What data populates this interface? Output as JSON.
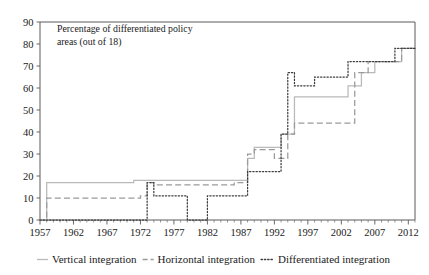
{
  "chart_data": {
    "type": "line",
    "title": "Percentage of differentiated policy areas (out of 18)",
    "title_line1": "Percentage of differentiated policy",
    "title_line2": "areas (out of 18)",
    "xlabel": "",
    "ylabel": "",
    "xlim": [
      1957,
      2013
    ],
    "ylim": [
      0,
      90
    ],
    "ytick_step": 10,
    "xtick_step": 5,
    "grid": false,
    "minor_ticks": "yearly",
    "legend_position": "bottom",
    "yticks": [
      0,
      10,
      20,
      30,
      40,
      50,
      60,
      70,
      80,
      90
    ],
    "xticks": [
      1957,
      1962,
      1967,
      1972,
      1977,
      1982,
      1987,
      1992,
      1997,
      2002,
      2007,
      2012
    ],
    "series": [
      {
        "name": "Vertical integration",
        "style": "solid",
        "color": "#b9b9b9",
        "x": [
          1957,
          1958,
          1959,
          1967,
          1968,
          1970,
          1971,
          1972,
          1973,
          1980,
          1981,
          1986,
          1987,
          1988,
          1989,
          1990,
          1991,
          1992,
          1993,
          1994,
          1995,
          1996,
          1997,
          1998,
          1999,
          2000,
          2001,
          2002,
          2003,
          2004,
          2005,
          2006,
          2007,
          2008,
          2009,
          2010,
          2011,
          2012,
          2013
        ],
        "values": [
          0,
          17,
          17,
          17,
          17,
          17,
          18,
          18,
          18,
          18,
          18,
          18,
          18,
          28,
          33,
          33,
          33,
          33,
          39,
          39,
          56,
          56,
          56,
          56,
          56,
          56,
          56,
          56,
          61,
          61,
          67,
          67,
          72,
          72,
          72,
          72,
          78,
          78,
          78
        ]
      },
      {
        "name": "Horizontal integration",
        "style": "dashed",
        "color": "#9a9a9a",
        "x": [
          1957,
          1958,
          1959,
          1967,
          1968,
          1971,
          1972,
          1973,
          1974,
          1980,
          1981,
          1985,
          1986,
          1987,
          1988,
          1989,
          1990,
          1991,
          1992,
          1993,
          1994,
          1995,
          1996,
          1997,
          1998,
          1999,
          2000,
          2001,
          2002,
          2003,
          2004,
          2005,
          2006,
          2007,
          2008,
          2009,
          2010,
          2011,
          2012,
          2013
        ],
        "values": [
          0,
          10,
          10,
          10,
          10,
          10,
          11,
          17,
          16,
          16,
          16,
          16,
          17,
          17,
          30,
          32,
          32,
          32,
          28,
          28,
          39,
          44,
          44,
          44,
          44,
          44,
          44,
          44,
          44,
          44,
          67,
          67,
          72,
          72,
          72,
          72,
          72,
          78,
          78,
          78
        ]
      },
      {
        "name": "Differentiated integration",
        "style": "dotted",
        "color": "#3c3c3c",
        "x": [
          1957,
          1972,
          1973,
          1974,
          1975,
          1978,
          1979,
          1980,
          1981,
          1982,
          1983,
          1986,
          1987,
          1988,
          1989,
          1990,
          1991,
          1992,
          1993,
          1994,
          1995,
          1996,
          1997,
          1998,
          1999,
          2000,
          2001,
          2002,
          2003,
          2004,
          2005,
          2006,
          2007,
          2008,
          2009,
          2010,
          2011,
          2012,
          2013
        ],
        "values": [
          0,
          0,
          17,
          11,
          11,
          11,
          0,
          0,
          0,
          11,
          11,
          11,
          11,
          22,
          22,
          22,
          22,
          22,
          39,
          67,
          61,
          61,
          61,
          65,
          65,
          65,
          65,
          65,
          72,
          72,
          72,
          72,
          72,
          72,
          72,
          78,
          78,
          78,
          78
        ]
      }
    ]
  },
  "legend": {
    "items": [
      {
        "label": "Vertical integration"
      },
      {
        "label": "Horizontal integration"
      },
      {
        "label": "Differentiated integration"
      }
    ]
  }
}
